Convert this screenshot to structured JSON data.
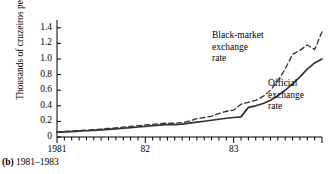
{
  "figure": {
    "caption_marker": "(b)",
    "caption_text": "1981–1983"
  },
  "chart_data": {
    "type": "line",
    "title": "",
    "xlabel": "",
    "ylabel": "Thousands of cruzeiros per U.S. dollar",
    "ylim": [
      0,
      1.5
    ],
    "yticks": [
      0,
      0.2,
      0.4,
      0.6,
      0.8,
      1.0,
      1.2,
      1.4
    ],
    "ytick_labels": [
      "0",
      "0.2",
      "0.4",
      "0.6",
      "0.8",
      "1.0",
      "1.2",
      "1.4"
    ],
    "xlim": [
      1981.0,
      1984.0
    ],
    "xticks": [
      1981,
      1982,
      1983
    ],
    "xtick_labels": [
      "1981",
      "82",
      "83"
    ],
    "minor_xticks_per_year": 12,
    "grid": false,
    "legend_position": "inline-annotations",
    "x": [
      1981.0,
      1981.083,
      1981.167,
      1981.25,
      1981.333,
      1981.417,
      1981.5,
      1981.583,
      1981.667,
      1981.75,
      1981.833,
      1981.917,
      1982.0,
      1982.083,
      1982.167,
      1982.25,
      1982.333,
      1982.417,
      1982.5,
      1982.583,
      1982.667,
      1982.75,
      1982.833,
      1982.917,
      1983.0,
      1983.083,
      1983.167,
      1983.25,
      1983.333,
      1983.417,
      1983.5,
      1983.583,
      1983.667,
      1983.75,
      1983.833,
      1983.917,
      1984.0
    ],
    "series": [
      {
        "name": "Black-market exchange rate",
        "style": "dashed",
        "color": "#333333",
        "annotation": "Black-market\nexchange\nrate",
        "values": [
          0.065,
          0.07,
          0.076,
          0.082,
          0.088,
          0.095,
          0.102,
          0.11,
          0.118,
          0.126,
          0.135,
          0.145,
          0.155,
          0.163,
          0.17,
          0.178,
          0.176,
          0.185,
          0.205,
          0.235,
          0.25,
          0.268,
          0.3,
          0.33,
          0.345,
          0.42,
          0.445,
          0.47,
          0.52,
          0.6,
          0.72,
          0.87,
          1.06,
          1.11,
          1.18,
          1.12,
          1.35
        ]
      },
      {
        "name": "Official exchange rate",
        "style": "solid",
        "color": "#333333",
        "annotation": "Official\nexchange\nrate",
        "values": [
          0.062,
          0.066,
          0.07,
          0.075,
          0.08,
          0.086,
          0.092,
          0.098,
          0.105,
          0.112,
          0.12,
          0.128,
          0.136,
          0.144,
          0.152,
          0.16,
          0.158,
          0.166,
          0.178,
          0.19,
          0.202,
          0.215,
          0.228,
          0.24,
          0.25,
          0.258,
          0.38,
          0.4,
          0.43,
          0.47,
          0.53,
          0.6,
          0.68,
          0.77,
          0.87,
          0.95,
          1.0
        ]
      }
    ]
  }
}
